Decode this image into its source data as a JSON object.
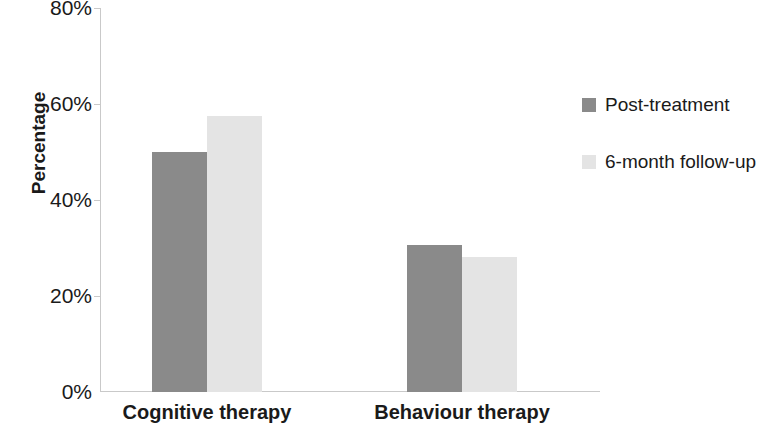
{
  "chart_data": {
    "type": "bar",
    "title": "",
    "subtitle": "",
    "xlabel": "",
    "ylabel": "Percentage",
    "categories": [
      "Cognitive therapy",
      "Behaviour therapy"
    ],
    "series": [
      {
        "name": "Post-treatment",
        "values": [
          50,
          30.6
        ],
        "color": "#8a8a8a"
      },
      {
        "name": "6-month follow-up",
        "values": [
          57.5,
          28.1
        ],
        "color": "#e4e4e4"
      }
    ],
    "ylim": [
      0,
      80
    ],
    "yticks": [
      0,
      20,
      40,
      60,
      80
    ],
    "ytick_labels": [
      "0%",
      "20%",
      "40%",
      "60%",
      "80%"
    ],
    "grid": false,
    "legend_position": "right",
    "axis_color": "#c9c9c9",
    "text_color": "#1a1a1a"
  },
  "legend": {
    "entries": [
      {
        "label": "Post-treatment",
        "swatch": "#8a8a8a"
      },
      {
        "label": "6-month follow-up",
        "swatch": "#e4e4e4"
      }
    ]
  }
}
